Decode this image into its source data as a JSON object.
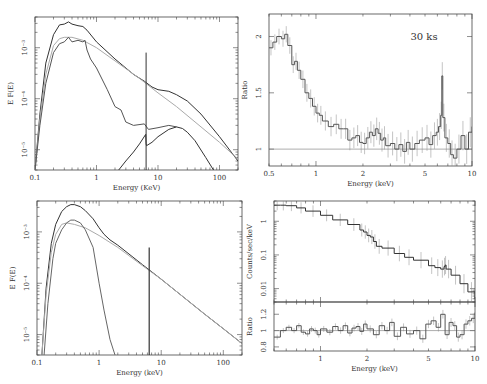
{
  "chart_data": [
    {
      "id": "top_left",
      "type": "line",
      "title": "",
      "xlabel": "Energy (KeV)",
      "ylabel": "E F(E)",
      "xscale": "log",
      "yscale": "log",
      "xlim": [
        0.1,
        200
      ],
      "ylim": [
        4e-06,
        0.004
      ],
      "xticks": [
        {
          "v": 0.1,
          "l": "0.1"
        },
        {
          "v": 1,
          "l": "1"
        },
        {
          "v": 10,
          "l": "10"
        },
        {
          "v": 100,
          "l": "100"
        }
      ],
      "yticks": [
        {
          "v": 1e-05,
          "l": "10⁻⁵"
        },
        {
          "v": 0.0001,
          "l": "10⁻⁴"
        },
        {
          "v": 0.001,
          "l": "10⁻³"
        }
      ],
      "series": [
        {
          "name": "total",
          "color": "#333333",
          "width": 1,
          "x": [
            0.1,
            0.12,
            0.15,
            0.2,
            0.25,
            0.3,
            0.35,
            0.4,
            0.5,
            0.6,
            0.7,
            1,
            2,
            4,
            6,
            8,
            10,
            15,
            20,
            30,
            50,
            100,
            200
          ],
          "y": [
            4e-06,
            5e-05,
            0.0005,
            0.0018,
            0.0028,
            0.0029,
            0.0032,
            0.0029,
            0.0027,
            0.0026,
            0.0022,
            0.0013,
            0.0006,
            0.0003,
            0.00022,
            0.00017,
            0.00015,
            0.00014,
            0.00012,
            9e-05,
            5e-05,
            1.8e-05,
            6e-06
          ]
        },
        {
          "name": "power-law",
          "color": "#aaaaaa",
          "width": 1,
          "x": [
            0.1,
            0.12,
            0.15,
            0.2,
            0.25,
            0.3,
            0.4,
            0.6,
            1,
            2,
            5,
            10,
            20,
            50,
            100,
            200
          ],
          "y": [
            4e-06,
            4e-05,
            0.0003,
            0.0011,
            0.0015,
            0.0016,
            0.0016,
            0.0014,
            0.001,
            0.00055,
            0.00025,
            0.00013,
            7e-05,
            2.8e-05,
            1.4e-05,
            6.5e-06
          ]
        },
        {
          "name": "soft component",
          "color": "#555555",
          "width": 1,
          "x": [
            0.1,
            0.12,
            0.15,
            0.2,
            0.25,
            0.3,
            0.35,
            0.4,
            0.5,
            0.6,
            0.65,
            0.7,
            0.8,
            1,
            1.5,
            2,
            2.5,
            3,
            4,
            6,
            7,
            10,
            15,
            20
          ],
          "y": [
            4e-06,
            3e-05,
            0.0002,
            0.0008,
            0.0012,
            0.0013,
            0.0016,
            0.0013,
            0.0014,
            0.0013,
            0.0014,
            0.0009,
            0.0006,
            0.0004,
            0.00015,
            7e-05,
            6e-05,
            3.5e-05,
            3e-05,
            3.2e-05,
            2.5e-05,
            2.7e-05,
            3e-05,
            2.8e-05
          ]
        },
        {
          "name": "reflection",
          "color": "#333333",
          "width": 1,
          "x": [
            2.3,
            3,
            4,
            5,
            6.3,
            6.4,
            6.5,
            8,
            10,
            15,
            20,
            25,
            30,
            40,
            60,
            80
          ],
          "y": [
            4e-06,
            6e-06,
            9e-06,
            1.3e-05,
            2e-05,
            1.3e-05,
            1.2e-05,
            1.4e-05,
            1.8e-05,
            2.5e-05,
            2.8e-05,
            2.6e-05,
            2.2e-05,
            1.5e-05,
            7e-06,
            4e-06
          ]
        },
        {
          "name": "Fe line",
          "color": "#333333",
          "width": 1,
          "x": [
            6.4,
            6.4
          ],
          "y": [
            4e-06,
            0.0008
          ]
        }
      ]
    },
    {
      "id": "top_right",
      "type": "line",
      "title": "",
      "annotation": "30 ks",
      "xlabel": "Energy (keV)",
      "ylabel": "Ratio",
      "xscale": "log",
      "yscale": "linear",
      "xlim": [
        0.5,
        10
      ],
      "ylim": [
        0.85,
        2.2
      ],
      "xticks": [
        {
          "v": 0.5,
          "l": "0.5"
        },
        {
          "v": 1,
          "l": "1"
        },
        {
          "v": 2,
          "l": "2"
        },
        {
          "v": 5,
          "l": "5"
        },
        {
          "v": 10,
          "l": "10"
        }
      ],
      "yticks": [
        {
          "v": 1,
          "l": "1"
        },
        {
          "v": 1.5,
          "l": "1.5"
        },
        {
          "v": 2,
          "l": "2"
        }
      ],
      "reference_line": 1,
      "series": [
        {
          "name": "data/model ratio",
          "color": "#555555",
          "width": 1,
          "x": [
            0.5,
            0.53,
            0.56,
            0.6,
            0.63,
            0.66,
            0.7,
            0.73,
            0.76,
            0.8,
            0.85,
            0.9,
            0.95,
            1,
            1.05,
            1.1,
            1.2,
            1.3,
            1.4,
            1.5,
            1.6,
            1.7,
            1.8,
            1.9,
            2,
            2.1,
            2.2,
            2.3,
            2.4,
            2.5,
            2.6,
            2.7,
            2.8,
            3,
            3.2,
            3.4,
            3.6,
            3.8,
            4,
            4.3,
            4.6,
            5,
            5.3,
            5.6,
            5.9,
            6.1,
            6.3,
            6.4,
            6.5,
            6.7,
            7,
            7.3,
            7.6,
            8,
            8.5,
            9,
            9.5,
            10
          ],
          "y": [
            1.9,
            1.95,
            2.0,
            1.98,
            2.02,
            1.92,
            1.75,
            1.78,
            1.7,
            1.62,
            1.5,
            1.45,
            1.38,
            1.32,
            1.3,
            1.25,
            1.2,
            1.22,
            1.18,
            1.18,
            1.08,
            1.1,
            1.12,
            1.06,
            1.05,
            1.1,
            1.15,
            1.12,
            1.18,
            1.14,
            1.08,
            1.1,
            1.03,
            1.05,
            1.0,
            1.04,
            0.98,
            1.06,
            1.0,
            1.05,
            1.08,
            1.1,
            1.04,
            1.12,
            1.15,
            1.2,
            1.3,
            1.65,
            1.28,
            1.1,
            1.05,
            0.95,
            0.92,
            1.0,
            1.12,
            1.0,
            1.15,
            1.2
          ]
        }
      ]
    },
    {
      "id": "bottom_left",
      "type": "line",
      "title": "",
      "xlabel": "Energy (keV)",
      "ylabel": "E F(E)",
      "xscale": "log",
      "yscale": "log",
      "xlim": [
        0.1,
        200
      ],
      "ylim": [
        4e-06,
        0.004
      ],
      "xticks": [
        {
          "v": 0.1,
          "l": "0.1"
        },
        {
          "v": 1,
          "l": "1"
        },
        {
          "v": 10,
          "l": "10"
        },
        {
          "v": 100,
          "l": "100"
        }
      ],
      "yticks": [
        {
          "v": 1e-05,
          "l": "10⁻⁵"
        },
        {
          "v": 0.0001,
          "l": "10⁻⁴"
        },
        {
          "v": 0.001,
          "l": "10⁻³"
        }
      ],
      "series": [
        {
          "name": "total",
          "color": "#333333",
          "width": 1,
          "x": [
            0.12,
            0.14,
            0.17,
            0.2,
            0.25,
            0.3,
            0.35,
            0.4,
            0.5,
            0.6,
            0.8,
            1,
            1.2,
            1.5,
            2,
            5,
            10,
            50,
            100,
            200
          ],
          "y": [
            4e-06,
            8e-05,
            0.0006,
            0.0014,
            0.0025,
            0.0031,
            0.0034,
            0.0034,
            0.0031,
            0.0026,
            0.0018,
            0.0012,
            0.0009,
            0.0007,
            0.00055,
            0.00023,
            0.00012,
            2.5e-05,
            1.3e-05,
            6.7e-06
          ]
        },
        {
          "name": "power-law",
          "color": "#aaaaaa",
          "width": 1,
          "x": [
            0.12,
            0.14,
            0.17,
            0.2,
            0.25,
            0.3,
            0.4,
            0.6,
            1,
            2,
            5,
            10,
            50,
            100,
            200
          ],
          "y": [
            4e-06,
            6e-05,
            0.0004,
            0.0009,
            0.0014,
            0.0015,
            0.0014,
            0.0012,
            0.00085,
            0.0005,
            0.00022,
            0.00012,
            2.5e-05,
            1.3e-05,
            6.7e-06
          ]
        },
        {
          "name": "blackbody",
          "color": "#666666",
          "width": 1,
          "x": [
            0.13,
            0.15,
            0.18,
            0.2,
            0.25,
            0.3,
            0.35,
            0.4,
            0.5,
            0.6,
            0.8,
            1,
            1.2,
            1.5,
            1.8
          ],
          "y": [
            4e-06,
            4e-05,
            0.0003,
            0.0006,
            0.0011,
            0.0015,
            0.0017,
            0.0017,
            0.0015,
            0.0011,
            0.0005,
            0.0001,
            3e-05,
            8e-06,
            4e-06
          ]
        },
        {
          "name": "Fe line",
          "color": "#333333",
          "width": 1.2,
          "x": [
            6.4,
            6.4
          ],
          "y": [
            4e-06,
            0.0005
          ]
        }
      ]
    },
    {
      "id": "bottom_right_upper",
      "type": "line",
      "title": "",
      "xlabel": "",
      "ylabel": "Counts/sec/keV",
      "xscale": "log",
      "yscale": "log",
      "xlim": [
        0.5,
        10
      ],
      "ylim": [
        0.004,
        4
      ],
      "xticks": [
        {
          "v": 1,
          "l": ""
        },
        {
          "v": 2,
          "l": ""
        },
        {
          "v": 5,
          "l": ""
        },
        {
          "v": 10,
          "l": ""
        }
      ],
      "yticks": [
        {
          "v": 0.01,
          "l": "0.01"
        },
        {
          "v": 0.1,
          "l": "0.1"
        },
        {
          "v": 1,
          "l": "1"
        }
      ],
      "series": [
        {
          "name": "counts spectrum",
          "color": "#333333",
          "width": 1,
          "x": [
            0.5,
            0.55,
            0.6,
            0.7,
            0.8,
            1,
            1.2,
            1.5,
            1.8,
            1.9,
            2.0,
            2.1,
            2.2,
            2.3,
            2.5,
            3,
            3.5,
            4,
            5,
            5.5,
            6,
            6.3,
            6.4,
            6.5,
            7,
            8,
            9,
            10
          ],
          "y": [
            3,
            3,
            2.9,
            2.5,
            2.0,
            1.5,
            1.1,
            0.8,
            0.55,
            0.48,
            0.38,
            0.34,
            0.25,
            0.18,
            0.16,
            0.11,
            0.085,
            0.07,
            0.048,
            0.042,
            0.038,
            0.045,
            0.05,
            0.038,
            0.025,
            0.014,
            0.008,
            0.005
          ]
        }
      ]
    },
    {
      "id": "bottom_right_lower",
      "type": "line",
      "title": "",
      "xlabel": "Energy (keV)",
      "ylabel": "Ratio",
      "xscale": "log",
      "yscale": "linear",
      "xlim": [
        0.5,
        10
      ],
      "ylim": [
        0.75,
        1.35
      ],
      "xticks": [
        {
          "v": 1,
          "l": "1"
        },
        {
          "v": 2,
          "l": "2"
        },
        {
          "v": 5,
          "l": "5"
        },
        {
          "v": 10,
          "l": "10"
        }
      ],
      "yticks": [
        {
          "v": 0.8,
          "l": "0.8"
        },
        {
          "v": 1,
          "l": "1"
        },
        {
          "v": 1.2,
          "l": "1.2"
        }
      ],
      "reference_line": 1,
      "series": [
        {
          "name": "data/model ratio",
          "color": "#555555",
          "width": 1,
          "x": [
            0.5,
            0.55,
            0.6,
            0.65,
            0.7,
            0.75,
            0.8,
            0.85,
            0.9,
            0.95,
            1,
            1.1,
            1.2,
            1.3,
            1.4,
            1.5,
            1.6,
            1.7,
            1.8,
            1.9,
            2,
            2.2,
            2.4,
            2.6,
            2.8,
            3,
            3.3,
            3.6,
            4,
            4.4,
            4.8,
            5.2,
            5.6,
            6,
            6.4,
            6.8,
            7.2,
            7.6,
            8,
            8.5,
            9,
            9.5,
            10
          ],
          "y": [
            0.92,
            1.0,
            1.04,
            1.0,
            1.06,
            0.98,
            0.96,
            1.02,
            1.0,
            0.95,
            1.02,
            0.98,
            1.05,
            1.0,
            1.06,
            0.97,
            1.03,
            1.05,
            0.99,
            1.08,
            1.02,
            0.95,
            1.06,
            1.0,
            1.1,
            0.93,
            1.04,
            0.96,
            1.0,
            0.9,
            1.08,
            1.12,
            1.04,
            1.2,
            0.95,
            1.1,
            1.06,
            0.92,
            0.95,
            1.08,
            1.12,
            1.15,
            1.22
          ]
        }
      ]
    }
  ],
  "figure": {
    "top_right_annotation": "30 ks"
  }
}
